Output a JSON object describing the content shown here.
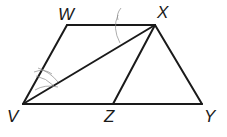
{
  "diagram": {
    "type": "geometry-figure",
    "points": {
      "W": {
        "label": "W",
        "x": 67,
        "y": 25
      },
      "X": {
        "label": "X",
        "x": 155,
        "y": 25
      },
      "V": {
        "label": "V",
        "x": 23,
        "y": 104
      },
      "Z": {
        "label": "Z",
        "x": 113,
        "y": 104
      },
      "Y": {
        "label": "Y",
        "x": 202,
        "y": 104
      }
    },
    "segments": [
      {
        "name": "WX",
        "from": "W",
        "to": "X"
      },
      {
        "name": "VW",
        "from": "V",
        "to": "W"
      },
      {
        "name": "VY",
        "from": "V",
        "to": "Y"
      },
      {
        "name": "XY",
        "from": "X",
        "to": "Y"
      },
      {
        "name": "VX",
        "from": "V",
        "to": "X"
      },
      {
        "name": "XZ",
        "from": "X",
        "to": "Z"
      }
    ],
    "annotations": [
      {
        "type": "angle-arc",
        "vertex": "X",
        "between": [
          "W",
          "V"
        ],
        "style": "pencil"
      },
      {
        "type": "angle-arc",
        "vertex": "V",
        "between": [
          "W",
          "X"
        ],
        "style": "pencil, double"
      }
    ],
    "colors": {
      "ink": "#1a1a1a",
      "pencil": "#8a8a8a",
      "background": "#ffffff"
    }
  }
}
